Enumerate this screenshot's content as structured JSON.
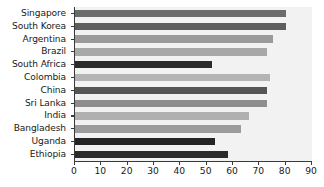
{
  "chart_data": {
    "type": "bar",
    "orientation": "horizontal",
    "title": "",
    "xlabel": "",
    "ylabel": "",
    "xlim": [
      0,
      90
    ],
    "xticks": [
      0,
      10,
      20,
      30,
      40,
      50,
      60,
      70,
      80,
      90
    ],
    "grid": false,
    "legend": null,
    "plot_background": "#f2f2f2",
    "axis_color": "#3a3a3a",
    "categories": [
      "Singapore",
      "South Korea",
      "Argentina",
      "Brazil",
      "South Africa",
      "Colombia",
      "China",
      "Sri Lanka",
      "India",
      "Bangladesh",
      "Uganda",
      "Ethiopia"
    ],
    "values": [
      80,
      80,
      75,
      73,
      52,
      74,
      73,
      73,
      66,
      63,
      53,
      58
    ],
    "bar_colors": [
      "#6b6b6b",
      "#5e5e5e",
      "#9a9a9a",
      "#a8a8a8",
      "#2b2b2b",
      "#b4b4b4",
      "#555555",
      "#8e8e8e",
      "#b0b0b0",
      "#9c9c9c",
      "#242424",
      "#2b2b2b"
    ],
    "bars": [
      {
        "label": "Singapore",
        "value": 80,
        "color": "#6b6b6b"
      },
      {
        "label": "South Korea",
        "value": 80,
        "color": "#5e5e5e"
      },
      {
        "label": "Argentina",
        "value": 75,
        "color": "#9a9a9a"
      },
      {
        "label": "Brazil",
        "value": 73,
        "color": "#a8a8a8"
      },
      {
        "label": "South Africa",
        "value": 52,
        "color": "#2b2b2b"
      },
      {
        "label": "Colombia",
        "value": 74,
        "color": "#b4b4b4"
      },
      {
        "label": "China",
        "value": 73,
        "color": "#555555"
      },
      {
        "label": "Sri Lanka",
        "value": 73,
        "color": "#8e8e8e"
      },
      {
        "label": "India",
        "value": 66,
        "color": "#b0b0b0"
      },
      {
        "label": "Bangladesh",
        "value": 63,
        "color": "#9c9c9c"
      },
      {
        "label": "Uganda",
        "value": 53,
        "color": "#242424"
      },
      {
        "label": "Ethiopia",
        "value": 58,
        "color": "#2b2b2b"
      }
    ]
  }
}
